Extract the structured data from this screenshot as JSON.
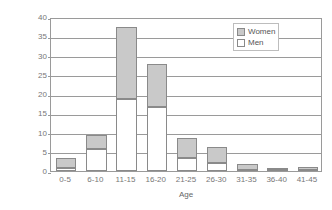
{
  "chart_data": {
    "type": "bar",
    "subtype": "stacked",
    "title": "",
    "xlabel": "Age",
    "ylabel": "Percent of Individuals",
    "categories": [
      "0-5",
      "6-10",
      "11-15",
      "16-20",
      "21-25",
      "26-30",
      "31-35",
      "36-40",
      "41-45"
    ],
    "series": [
      {
        "name": "Men",
        "color": "#ffffff",
        "values": [
          0.9,
          5.8,
          18.7,
          16.5,
          3.5,
          2.0,
          0.2,
          0.1,
          0.1
        ]
      },
      {
        "name": "Women",
        "color": "#c9c9c9",
        "values": [
          2.6,
          3.6,
          18.8,
          11.3,
          5.2,
          4.2,
          1.5,
          0.6,
          0.8
        ]
      }
    ],
    "totals": [
      3.5,
      9.4,
      37.5,
      27.8,
      8.7,
      6.2,
      1.7,
      0.7,
      0.9
    ],
    "ylim": [
      0,
      40
    ],
    "yticks": [
      0,
      5,
      10,
      15,
      20,
      25,
      30,
      35,
      40
    ],
    "ytick_labels": [
      "0",
      "5",
      "10",
      "15",
      "20",
      "25",
      "30",
      "35",
      "40"
    ],
    "grid": true,
    "grid_axis": "y",
    "legend_position": "top-right",
    "legend_entries": [
      "Women",
      "Men"
    ]
  },
  "legend": {
    "women_label": "Women",
    "men_label": "Men"
  },
  "axes": {
    "x_title": "Age",
    "y_title": "Percent of Individuals"
  },
  "colors": {
    "women_fill": "#c9c9c9",
    "men_fill": "#ffffff",
    "bar_stroke": "#8a8a8a",
    "axis": "#9a9a9a",
    "text": "#666666",
    "background": "#ffffff"
  }
}
